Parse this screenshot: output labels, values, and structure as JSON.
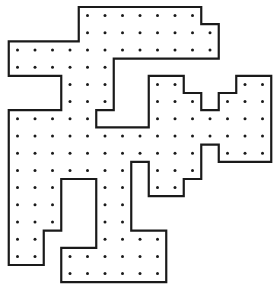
{
  "figure": {
    "colors": {
      "outline": "#1a1a1a",
      "dot": "#1a1a1a",
      "background": "#ffffff"
    },
    "grid": {
      "columns": 15,
      "rows": 16,
      "origin_x": 8.75,
      "origin_y": 7,
      "cell_w": 17.5,
      "cell_h": 17.2
    },
    "outline_vertices": [
      [
        4,
        0
      ],
      [
        11,
        0
      ],
      [
        11,
        1
      ],
      [
        12,
        1
      ],
      [
        12,
        3
      ],
      [
        6,
        3
      ],
      [
        6,
        6
      ],
      [
        5,
        6
      ],
      [
        5,
        7
      ],
      [
        8,
        7
      ],
      [
        8,
        4
      ],
      [
        10,
        4
      ],
      [
        10,
        5
      ],
      [
        11,
        5
      ],
      [
        11,
        6
      ],
      [
        12,
        6
      ],
      [
        12,
        5
      ],
      [
        13,
        5
      ],
      [
        13,
        4
      ],
      [
        15,
        4
      ],
      [
        15,
        9
      ],
      [
        12,
        9
      ],
      [
        12,
        8
      ],
      [
        11,
        8
      ],
      [
        11,
        10
      ],
      [
        10,
        10
      ],
      [
        10,
        11
      ],
      [
        8,
        11
      ],
      [
        8,
        9
      ],
      [
        7,
        9
      ],
      [
        7,
        13
      ],
      [
        9,
        13
      ],
      [
        9,
        16
      ],
      [
        3,
        16
      ],
      [
        3,
        14
      ],
      [
        5,
        14
      ],
      [
        5,
        10
      ],
      [
        3,
        10
      ],
      [
        3,
        13
      ],
      [
        2,
        13
      ],
      [
        2,
        15
      ],
      [
        0,
        15
      ],
      [
        0,
        6
      ],
      [
        3,
        6
      ],
      [
        3,
        4
      ],
      [
        0,
        4
      ],
      [
        0,
        2
      ],
      [
        4,
        2
      ]
    ],
    "dot_rows": [
      [
        [
          4,
          10
        ]
      ],
      [
        [
          4,
          11
        ]
      ],
      [
        [
          0,
          11
        ]
      ],
      [
        [
          0,
          5
        ]
      ],
      [
        [
          3,
          5
        ],
        [
          8,
          9
        ],
        [
          13,
          14
        ]
      ],
      [
        [
          3,
          5
        ],
        [
          8,
          10
        ],
        [
          12,
          14
        ]
      ],
      [
        [
          0,
          4
        ],
        [
          8,
          14
        ]
      ],
      [
        [
          0,
          14
        ]
      ],
      [
        [
          0,
          10
        ],
        [
          12,
          14
        ]
      ],
      [
        [
          0,
          6
        ],
        [
          8,
          10
        ]
      ],
      [
        [
          0,
          2
        ],
        [
          5,
          6
        ],
        [
          8,
          9
        ]
      ],
      [
        [
          0,
          2
        ],
        [
          5,
          6
        ]
      ],
      [
        [
          0,
          2
        ],
        [
          5,
          6
        ]
      ],
      [
        [
          0,
          1
        ],
        [
          5,
          8
        ]
      ],
      [
        [
          0,
          1
        ],
        [
          3,
          8
        ]
      ],
      [
        [
          3,
          8
        ]
      ]
    ]
  }
}
